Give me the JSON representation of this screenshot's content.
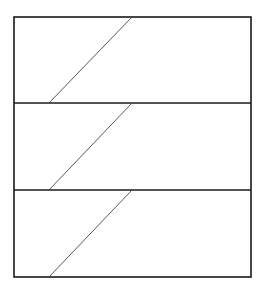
{
  "diagram": {
    "canvas": {
      "width": 265,
      "height": 293,
      "background": "#ffffff"
    },
    "frame": {
      "x": 14,
      "y": 17,
      "width": 237,
      "height": 260,
      "stroke": "#1a1a1a",
      "stroke_width": 1.6
    },
    "dividers": [
      {
        "y": 103,
        "stroke": "#1a1a1a",
        "stroke_width": 1.6
      },
      {
        "y": 190,
        "stroke": "#1a1a1a",
        "stroke_width": 1.6
      }
    ],
    "panels": [
      {
        "index": 1,
        "top": 17,
        "bottom": 103,
        "diagonal": {
          "x1": 49,
          "y1": 103,
          "x2": 132,
          "y2": 17
        }
      },
      {
        "index": 2,
        "top": 103,
        "bottom": 190,
        "diagonal": {
          "x1": 49,
          "y1": 190,
          "x2": 132,
          "y2": 103
        }
      },
      {
        "index": 3,
        "top": 190,
        "bottom": 277,
        "diagonal": {
          "x1": 49,
          "y1": 277,
          "x2": 132,
          "y2": 190
        }
      }
    ],
    "diagonal_stroke": "#444444",
    "diagonal_stroke_width": 0.9
  }
}
